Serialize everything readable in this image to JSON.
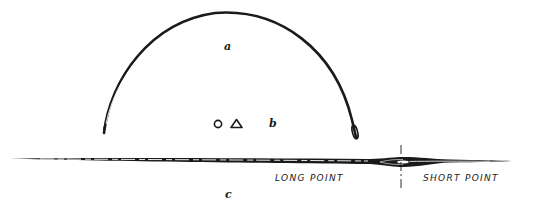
{
  "figure": {
    "labels": {
      "a": "a",
      "b": "b",
      "c": "c",
      "long_point": "LONG POINT",
      "short_point": "SHORT POINT"
    },
    "parts": [
      {
        "id": "a",
        "description": "curved needle (half-circle) with pointed tip on left and eye on right"
      },
      {
        "id": "b",
        "description": "cross-section shapes: circle and triangle"
      },
      {
        "id": "c",
        "description": "straight double-pointed needle with central eye dividing long point and short point"
      }
    ],
    "colors": {
      "ink": "#1a1a1a",
      "background": "#ffffff"
    }
  }
}
